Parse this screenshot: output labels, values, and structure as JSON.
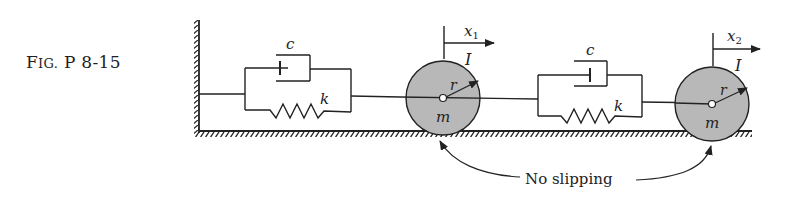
{
  "figure": {
    "caption": {
      "prefix": "F",
      "smallcaps": "IG.",
      "rest": " P 8-15"
    },
    "damper_label_1": "c",
    "spring_label_1": "k",
    "damper_label_2": "c",
    "spring_label_2": "k",
    "disk1": {
      "displacement": "x",
      "displacement_sub": "1",
      "inertia": "I",
      "radius": "r",
      "mass": "m"
    },
    "disk2": {
      "displacement": "x",
      "displacement_sub": "2",
      "inertia": "I",
      "radius": "r",
      "mass": "m"
    },
    "annotation": "No slipping",
    "colors": {
      "disk_fill": "#b8b8b8",
      "line": "#222222",
      "background": "#ffffff"
    }
  }
}
